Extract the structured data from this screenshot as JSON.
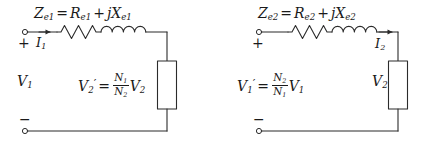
{
  "figure": {
    "type": "circuit-diagram",
    "stroke_color": "#2b2b2b",
    "text_color": "#1a1a1a",
    "background_color": "#ffffff"
  },
  "circuits": [
    {
      "id": "primary-referred",
      "impedance_label": {
        "symbol": "Z",
        "subscript": "e1",
        "equals": "=",
        "resistance": "R",
        "resistance_subscript": "e1",
        "plus": "+",
        "j": "j",
        "reactance": "X",
        "reactance_subscript": "e2"
      },
      "impedance_text": "Ze1 = Re1 + jXe1",
      "source_label": "V1",
      "source_symbol": "V",
      "source_subscript": "1",
      "current_symbol": "I",
      "current_subscript": "1",
      "current_text": "I1",
      "terminal_plus": "+",
      "terminal_minus": "−",
      "load_label_text": "V'2 = (N1/N2) V2",
      "load_label": {
        "v": "V",
        "v_sub": "2",
        "prime": "′",
        "equals": "=",
        "num": "N",
        "num_sub": "1",
        "den": "N",
        "den_sub": "2",
        "tail_v": "V",
        "tail_sub": "2"
      },
      "elements": [
        "terminal-circle",
        "current-arrow",
        "resistor",
        "inductor",
        "load-box"
      ]
    },
    {
      "id": "secondary-referred",
      "impedance_label": {
        "symbol": "Z",
        "subscript": "e2",
        "equals": "=",
        "resistance": "R",
        "resistance_subscript": "e2",
        "plus": "+",
        "j": "j",
        "reactance": "X",
        "reactance_subscript": "e2"
      },
      "impedance_text": "Ze2 = Re2 + jXe2",
      "source_label_text": "V'1 = (N2/N1) V1",
      "source_label": {
        "v": "V",
        "v_sub": "1",
        "prime": "′",
        "equals": "=",
        "num": "N",
        "num_sub": "2",
        "den": "N",
        "den_sub": "1",
        "tail_v": "V",
        "tail_sub": "1"
      },
      "current_symbol": "I",
      "current_subscript": "2",
      "current_text": "I2",
      "load_symbol": "V",
      "load_subscript": "2",
      "load_text": "V2",
      "terminal_plus": "+",
      "terminal_minus": "−",
      "elements": [
        "terminal-circle",
        "resistor",
        "inductor",
        "current-arrow",
        "load-box"
      ]
    }
  ]
}
